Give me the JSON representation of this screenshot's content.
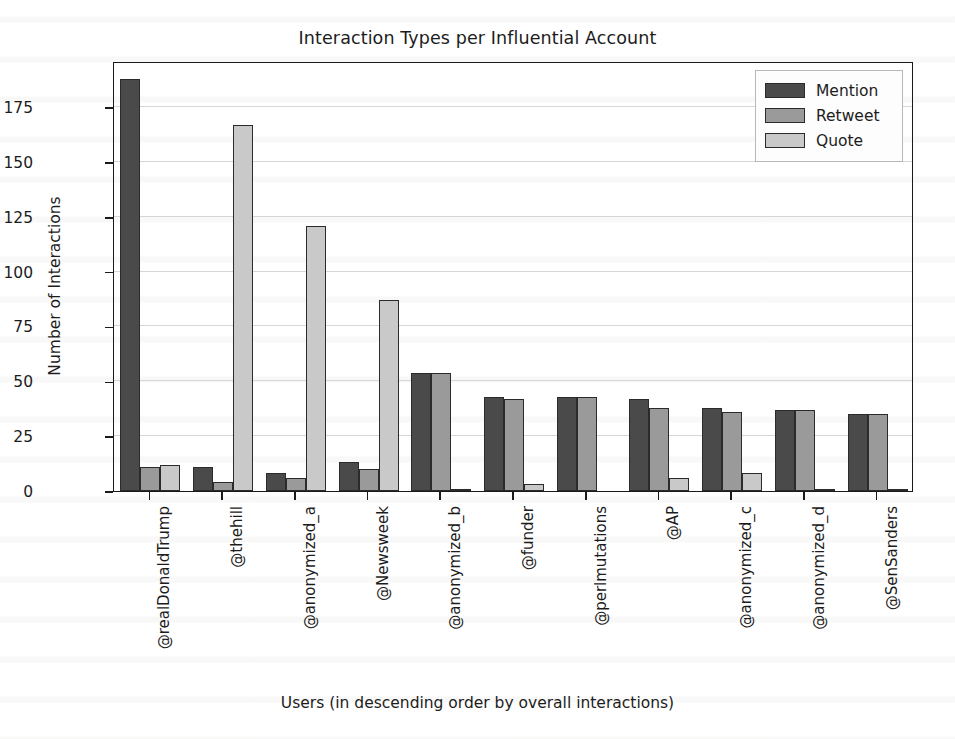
{
  "chart_data": {
    "type": "bar",
    "title": "Interaction Types per Influential Account",
    "xlabel": "Users (in descending order by overall interactions)",
    "ylabel": "Number of Interactions",
    "ylim": [
      0,
      196
    ],
    "yticks": [
      0,
      25,
      50,
      75,
      100,
      125,
      150,
      175
    ],
    "ytick_labels": [
      "0",
      "25",
      "50",
      "75",
      "100",
      "125",
      "150",
      "175"
    ],
    "grid": true,
    "legend_position": "upper right",
    "categories": [
      "@realDonaldTrump",
      "@thehill",
      "@anonymized_a",
      "@Newsweek",
      "@anonymized_b",
      "@funder",
      "@perlmutations",
      "@AP",
      "@anonymized_c",
      "@anonymized_d",
      "@SenSanders"
    ],
    "series": [
      {
        "name": "Mention",
        "color": "#4a4a4a",
        "values": [
          188,
          11,
          8,
          13,
          54,
          43,
          43,
          42,
          38,
          37,
          35
        ]
      },
      {
        "name": "Retweet",
        "color": "#9a9a9a",
        "values": [
          11,
          4,
          6,
          10,
          54,
          42,
          43,
          38,
          36,
          37,
          35
        ]
      },
      {
        "name": "Quote",
        "color": "#c9c9c9",
        "values": [
          12,
          167,
          121,
          87,
          1,
          3,
          0,
          6,
          8,
          1,
          1
        ]
      }
    ]
  },
  "legend": {
    "items": [
      {
        "label": "Mention",
        "swatch": "mention"
      },
      {
        "label": "Retweet",
        "swatch": "retweet"
      },
      {
        "label": "Quote",
        "swatch": "quote"
      }
    ]
  }
}
